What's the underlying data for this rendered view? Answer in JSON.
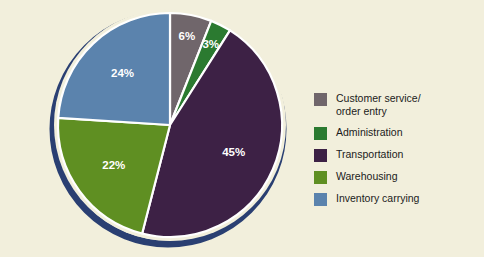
{
  "figure": {
    "background_color": "#f2efdc",
    "pie_ring_color": "#2a3f72",
    "slice_divider_color": "#ffffff",
    "label_text_color": "#ffffff"
  },
  "chart_data": {
    "type": "pie",
    "title": "",
    "subtitle": "",
    "xlabel": "",
    "ylabel": "",
    "legend_position": "right",
    "grid": false,
    "start_angle_deg": 0,
    "direction": "clockwise",
    "categories": [
      "Customer service/\norder entry",
      "Administration",
      "Transportation",
      "Warehousing",
      "Inventory carrying"
    ],
    "values": [
      6,
      3,
      45,
      22,
      24
    ],
    "value_labels": [
      "6%",
      "3%",
      "45%",
      "22%",
      "24%"
    ],
    "colors": [
      "#70666b",
      "#2b7a30",
      "#3d2145",
      "#5f8f22",
      "#5b83ad"
    ],
    "slices": [
      {
        "label": "Customer service/\norder entry",
        "value": 6,
        "value_label": "6%",
        "color": "#70666b"
      },
      {
        "label": "Administration",
        "value": 3,
        "value_label": "3%",
        "color": "#2b7a30"
      },
      {
        "label": "Transportation",
        "value": 45,
        "value_label": "45%",
        "color": "#3d2145"
      },
      {
        "label": "Warehousing",
        "value": 22,
        "value_label": "22%",
        "color": "#5f8f22"
      },
      {
        "label": "Inventory carrying",
        "value": 24,
        "value_label": "24%",
        "color": "#5b83ad"
      }
    ]
  },
  "legend": {
    "items": [
      {
        "label": "Customer service/\norder entry",
        "color": "#70666b"
      },
      {
        "label": "Administration",
        "color": "#2b7a30"
      },
      {
        "label": "Transportation",
        "color": "#3d2145"
      },
      {
        "label": "Warehousing",
        "color": "#5f8f22"
      },
      {
        "label": "Inventory carrying",
        "color": "#5b83ad"
      }
    ]
  }
}
